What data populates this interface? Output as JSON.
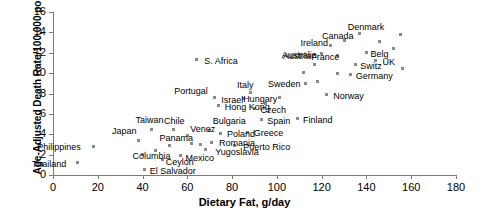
{
  "chart_data": {
    "type": "scatter",
    "title": "",
    "xlabel": "Dietary Fat, g/day",
    "ylabel": "Age-Adjusted Death Rate/100,000 pop.",
    "xlim": [
      0,
      180
    ],
    "ylim": [
      0,
      16
    ],
    "xticks": [
      0,
      20,
      40,
      60,
      80,
      100,
      120,
      140,
      160,
      180
    ],
    "yticks": [
      0,
      2,
      4,
      6,
      8,
      10,
      12,
      14,
      16
    ],
    "grid": false,
    "legend": null,
    "marker_color": "#8a8a8a",
    "axis_color": "#7a7a7a",
    "points": [
      {
        "label": "Thailand",
        "x": 11,
        "y": 1.2,
        "lx": -46,
        "ly": -4
      },
      {
        "label": "Philippines",
        "x": 18,
        "y": 2.8,
        "lx": -56,
        "ly": -4
      },
      {
        "label": "Japan",
        "x": 38,
        "y": 3.4,
        "lx": -26,
        "ly": -14
      },
      {
        "label": "Columbia",
        "x": 40,
        "y": 2.0,
        "lx": -10,
        "ly": -4
      },
      {
        "label": "El Salvador",
        "x": 41,
        "y": 0.5,
        "lx": 5,
        "ly": -4
      },
      {
        "label": "Taiwan",
        "x": 44,
        "y": 4.5,
        "lx": -16,
        "ly": -14
      },
      {
        "label": "Ceylon",
        "x": 49,
        "y": 1.5,
        "lx": 3,
        "ly": -3
      },
      {
        "label": "Panama",
        "x": 52,
        "y": 2.9,
        "lx": -10,
        "ly": -12
      },
      {
        "label": "Chile",
        "x": 54,
        "y": 4.5,
        "lx": -10,
        "ly": -13
      },
      {
        "label": "Mexico",
        "x": 57,
        "y": 1.9,
        "lx": 5,
        "ly": -3
      },
      {
        "label": "Venez",
        "x": 60,
        "y": 3.9,
        "lx": 3,
        "ly": -11
      },
      {
        "label": "Portugal",
        "x": 72,
        "y": 7.6,
        "lx": -40,
        "ly": -12
      },
      {
        "label": "S. Africa",
        "x": 64,
        "y": 11.3,
        "lx": 8,
        "ly": -4
      },
      {
        "label": "Yugoslavia",
        "x": 68,
        "y": 2.5,
        "lx": 10,
        "ly": -3
      },
      {
        "label": "Bulgaria",
        "x": 70,
        "y": 4.4,
        "lx": 3,
        "ly": -14
      },
      {
        "label": "Romania",
        "x": 71,
        "y": 3.2,
        "lx": 7,
        "ly": -4
      },
      {
        "label": "Poland",
        "x": 75,
        "y": 4.1,
        "lx": 6,
        "ly": -4
      },
      {
        "label": "Hong Kong",
        "x": 74,
        "y": 6.8,
        "lx": 6,
        "ly": -4
      },
      {
        "label": "Israel",
        "x": 85,
        "y": 7.5,
        "lx": -22,
        "ly": -4
      },
      {
        "label": "Italy",
        "x": 88,
        "y": 8.1,
        "lx": -13,
        "ly": -12
      },
      {
        "label": "Puerto Rico",
        "x": 81,
        "y": 2.9,
        "lx": 9,
        "ly": -3
      },
      {
        "label": "Greece",
        "x": 87,
        "y": 4.2,
        "lx": 6,
        "ly": -4
      },
      {
        "label": "Czech",
        "x": 90,
        "y": 6.5,
        "lx": 6,
        "ly": -4
      },
      {
        "label": "Spain",
        "x": 93,
        "y": 5.4,
        "lx": 6,
        "ly": -4
      },
      {
        "label": "Hungary",
        "x": 101,
        "y": 7.6,
        "lx": -36,
        "ly": -4
      },
      {
        "label": "Finland",
        "x": 109,
        "y": 5.5,
        "lx": 6,
        "ly": -4
      },
      {
        "label": "Sweden",
        "x": 113,
        "y": 9.0,
        "lx": -38,
        "ly": -4
      },
      {
        "label": "Austria",
        "x": 117,
        "y": 10.8,
        "lx": -32,
        "ly": -14
      },
      {
        "label": "Australia",
        "x": 120,
        "y": 11.9,
        "lx": -40,
        "ly": -4
      },
      {
        "label": "Ireland",
        "x": 124,
        "y": 12.7,
        "lx": -30,
        "ly": -8
      },
      {
        "label": "Norway",
        "x": 122,
        "y": 7.9,
        "lx": 7,
        "ly": -4
      },
      {
        "label": "France",
        "x": 127,
        "y": 11.7,
        "lx": -26,
        "ly": -4
      },
      {
        "label": "Canada",
        "x": 130,
        "y": 13.2,
        "lx": -22,
        "ly": -10
      },
      {
        "label": "Germany",
        "x": 133,
        "y": 9.9,
        "lx": 5,
        "ly": -3
      },
      {
        "label": "Switz",
        "x": 135,
        "y": 10.8,
        "lx": 5,
        "ly": -4
      },
      {
        "label": "Denmark",
        "x": 137,
        "y": 13.9,
        "lx": -12,
        "ly": -11
      },
      {
        "label": "Belg",
        "x": 140,
        "y": 12.0,
        "lx": 4,
        "ly": -4
      },
      {
        "label": "UK",
        "x": 144,
        "y": 11.2,
        "lx": 7,
        "ly": -4
      },
      {
        "label": "",
        "x": 146,
        "y": 13.1,
        "lx": 0,
        "ly": 0
      },
      {
        "label": "",
        "x": 152,
        "y": 12.4,
        "lx": 0,
        "ly": 0
      },
      {
        "label": "",
        "x": 155,
        "y": 13.8,
        "lx": 0,
        "ly": 0
      },
      {
        "label": "",
        "x": 156,
        "y": 10.5,
        "lx": 0,
        "ly": 0
      },
      {
        "label": "",
        "x": 127,
        "y": 10.0,
        "lx": 0,
        "ly": 0
      },
      {
        "label": "",
        "x": 118,
        "y": 9.2,
        "lx": 0,
        "ly": 0
      },
      {
        "label": "",
        "x": 112,
        "y": 10.1,
        "lx": 0,
        "ly": 0
      },
      {
        "label": "",
        "x": 95,
        "y": 7.0,
        "lx": 0,
        "ly": 0
      },
      {
        "label": "",
        "x": 62,
        "y": 3.1,
        "lx": 0,
        "ly": 0
      },
      {
        "label": "",
        "x": 66,
        "y": 3.0,
        "lx": 0,
        "ly": 0
      },
      {
        "label": "",
        "x": 46,
        "y": 2.4,
        "lx": 0,
        "ly": 0
      }
    ]
  }
}
